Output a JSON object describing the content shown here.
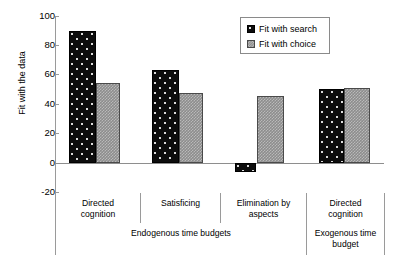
{
  "chart_data": {
    "type": "bar",
    "title": "",
    "xlabel": "",
    "ylabel": "Fit with the data",
    "ylim": [
      -20,
      100
    ],
    "yticks": [
      100,
      80,
      60,
      40,
      20,
      0,
      -20
    ],
    "ytick_labels": [
      "100",
      "80",
      "60",
      "40",
      "20",
      "0",
      "-20"
    ],
    "grid": false,
    "legend_position": "top-right",
    "categories": [
      "Directed cognition",
      "Satisficing",
      "Elimination by aspects",
      "Directed cognition"
    ],
    "category_lines": [
      [
        "Directed",
        "cognition"
      ],
      [
        "Satisficing",
        ""
      ],
      [
        "Elimination by",
        "aspects"
      ],
      [
        "Directed",
        "cognition"
      ]
    ],
    "groups": [
      {
        "label_lines": [
          "Endogenous time budgets",
          ""
        ],
        "label": "Endogenous time budgets",
        "span": 3
      },
      {
        "label_lines": [
          "Exogenous time",
          "budget"
        ],
        "label": "Exogenous time budget",
        "span": 1
      }
    ],
    "series": [
      {
        "name": "Fit with search",
        "color": "#0d0d0d",
        "pattern": "dotted",
        "values": [
          91,
          64,
          -6,
          51
        ]
      },
      {
        "name": "Fit with choice",
        "color": "#8d8d8d",
        "pattern": "checkered",
        "values": [
          55,
          48,
          46,
          52
        ]
      }
    ]
  },
  "legend": {
    "items": [
      {
        "label": "Fit with search"
      },
      {
        "label": "Fit with choice"
      }
    ]
  }
}
